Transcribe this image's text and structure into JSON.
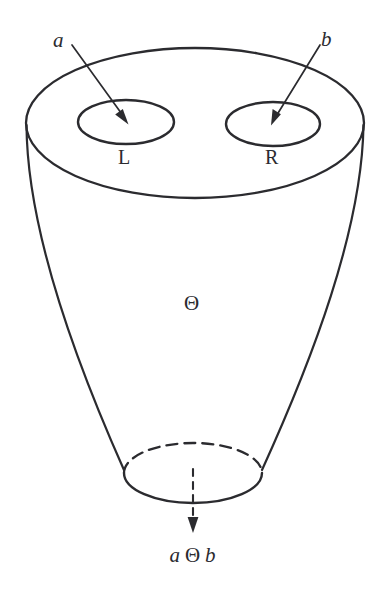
{
  "figure": {
    "background_color": "#ffffff",
    "ink_color": "#2b2b2f",
    "width": 385,
    "height": 597
  },
  "labels": {
    "input_left": "a",
    "input_right": "b",
    "hole_left": "L",
    "hole_right": "R",
    "operator": "Θ",
    "result_left_operand": "a",
    "result_operator": "Θ",
    "result_right_operand": "b",
    "result_full": "a Θ b"
  },
  "icons": {
    "arrow_a": "arrow-down-right-icon",
    "arrow_b": "arrow-down-left-icon",
    "arrow_output": "dashed-arrow-down-icon"
  },
  "geometry": {
    "outer_rim": {
      "cx": 195,
      "cy": 123,
      "rx": 169,
      "ry": 75
    },
    "hole_left": {
      "cx": 126,
      "cy": 122,
      "rx": 48,
      "ry": 22
    },
    "hole_right": {
      "cx": 273,
      "cy": 124,
      "rx": 47,
      "ry": 22
    },
    "bottom_mouth": {
      "cx": 193,
      "cy": 473,
      "rx": 69,
      "ry": 30
    }
  }
}
